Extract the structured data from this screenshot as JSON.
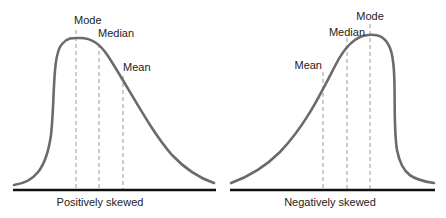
{
  "panels": [
    {
      "caption": "Positively skewed",
      "labels": {
        "mode": "Mode",
        "median": "Median",
        "mean": "Mean"
      }
    },
    {
      "caption": "Negatively skewed",
      "labels": {
        "mode": "Mode",
        "median": "Median",
        "mean": "Mean"
      }
    }
  ],
  "colors": {
    "curve": "#6b6b6b",
    "baseline": "#111111",
    "guide": "#9a9a9a",
    "text": "#222222"
  }
}
